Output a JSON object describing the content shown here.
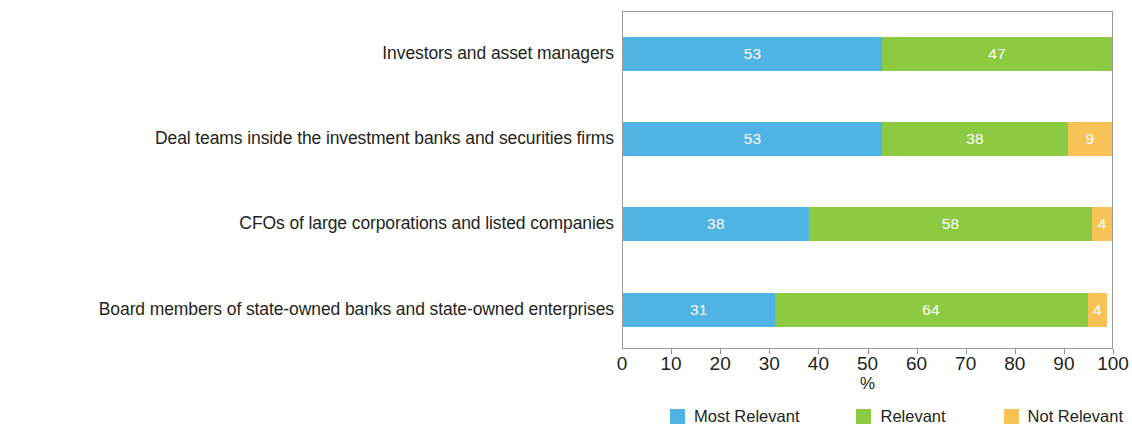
{
  "chart_data": {
    "type": "bar",
    "orientation": "horizontal",
    "stacked": true,
    "stack_total": 100,
    "title": "",
    "subtitle": "",
    "xlabel": "%",
    "ylabel": "",
    "xlim": [
      0,
      100
    ],
    "xticks": [
      0,
      10,
      20,
      30,
      40,
      50,
      60,
      70,
      80,
      90,
      100
    ],
    "xtick_labels": [
      "0",
      "10",
      "20",
      "30",
      "40",
      "50",
      "60",
      "70",
      "80",
      "90",
      "100"
    ],
    "grid": false,
    "legend_position": "bottom",
    "categories": [
      "Investors and asset managers",
      "Deal teams inside the investment banks and securities firms",
      "CFOs of large corporations and listed companies",
      "Board members of state-owned banks and state-owned enterprises"
    ],
    "series": [
      {
        "name": "Most Relevant",
        "color": "#4FB3E3",
        "values": [
          53,
          53,
          38,
          31
        ],
        "labels": [
          "53",
          "53",
          "38",
          "31"
        ]
      },
      {
        "name": "Relevant",
        "color": "#8CCB41",
        "values": [
          47,
          38,
          58,
          64
        ],
        "labels": [
          "47",
          "38",
          "58",
          "64"
        ]
      },
      {
        "name": "Not Relevant",
        "color": "#F7C357",
        "values": [
          0,
          9,
          4,
          4
        ],
        "labels": [
          "",
          "9",
          "4",
          "4"
        ]
      }
    ],
    "label_text_color": "#FFFFFF",
    "axis_color": "#9A9A9A",
    "text_color": "#231F20"
  },
  "legend": {
    "items": [
      {
        "label": "Most Relevant",
        "color": "#4FB3E3"
      },
      {
        "label": "Relevant",
        "color": "#8CCB41"
      },
      {
        "label": "Not Relevant",
        "color": "#F7C357"
      }
    ]
  }
}
